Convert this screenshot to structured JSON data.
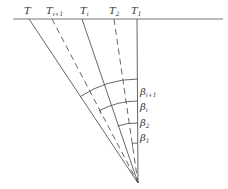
{
  "diagram": {
    "type": "fan-ray-angle-diagram",
    "baseline": {
      "x1": 13,
      "x2": 223,
      "y": 19
    },
    "apex": {
      "x": 138,
      "y": 183
    },
    "rays": [
      {
        "id": "T",
        "label": "T",
        "sub": "",
        "x": 29,
        "style": "solid"
      },
      {
        "id": "Ti1",
        "label": "T",
        "sub": "i+1",
        "x": 52,
        "style": "dashed"
      },
      {
        "id": "Ti",
        "label": "T",
        "sub": "i",
        "x": 82,
        "style": "solid"
      },
      {
        "id": "T2",
        "label": "T",
        "sub": "2",
        "x": 114,
        "style": "dashed"
      },
      {
        "id": "T1",
        "label": "T",
        "sub": "1",
        "x": 137,
        "style": "solid"
      }
    ],
    "angles": [
      {
        "label": "β",
        "sub": "i+1",
        "radius": 104,
        "from_ray": "T"
      },
      {
        "label": "β",
        "sub": "i",
        "radius": 82,
        "from_ray": "Ti1"
      },
      {
        "label": "β",
        "sub": "2",
        "radius": 60,
        "from_ray": "Ti"
      },
      {
        "label": "β",
        "sub": "1",
        "radius": 40,
        "from_ray": "T2"
      }
    ],
    "colors": {
      "line": "#555555",
      "text": "#333333"
    }
  }
}
